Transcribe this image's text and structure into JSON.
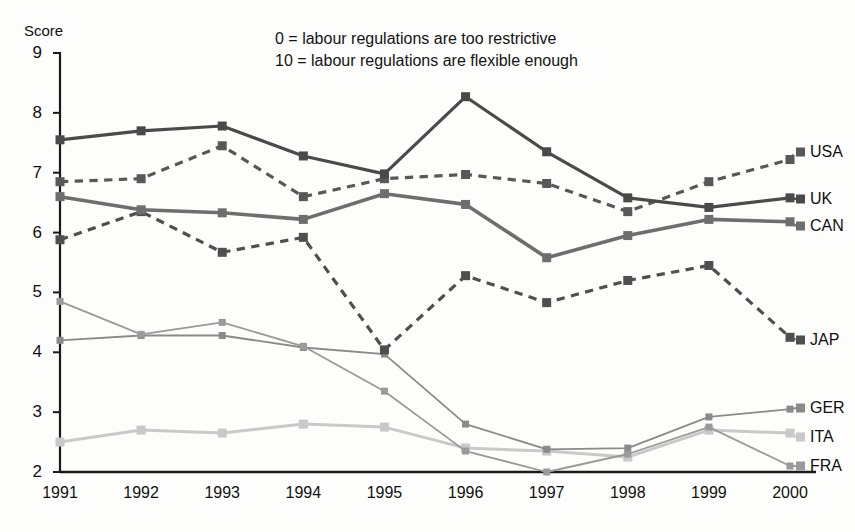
{
  "chart_data": {
    "type": "line",
    "title": "",
    "xlabel": "",
    "ylabel": "Score",
    "categories": [
      "1991",
      "1992",
      "1993",
      "1994",
      "1995",
      "1996",
      "1997",
      "1998",
      "1999",
      "2000"
    ],
    "ylim": [
      2,
      9
    ],
    "yticks": [
      2,
      3,
      4,
      5,
      6,
      7,
      8,
      9
    ],
    "grid": false,
    "legend_position": "right-of-plot-end-labels",
    "annotations": [
      "0 = labour regulations are too restrictive",
      "10 = labour regulations are flexible enough"
    ],
    "series": [
      {
        "name": "UK",
        "style": "solid",
        "color": "#4a4a4a",
        "width": 3.2,
        "values": [
          7.55,
          7.7,
          7.78,
          7.28,
          6.98,
          8.27,
          7.35,
          6.58,
          6.42,
          6.58
        ]
      },
      {
        "name": "CAN",
        "style": "solid",
        "color": "#6e6e6e",
        "width": 3.6,
        "values": [
          6.6,
          6.38,
          6.33,
          6.22,
          6.65,
          6.47,
          5.58,
          5.95,
          6.22,
          6.18
        ]
      },
      {
        "name": "USA",
        "style": "dashed",
        "color": "#585858",
        "width": 3.2,
        "values": [
          6.85,
          6.9,
          7.45,
          6.6,
          6.9,
          6.97,
          6.82,
          6.35,
          6.85,
          7.22
        ]
      },
      {
        "name": "JAP",
        "style": "dashed",
        "color": "#4f4f4f",
        "width": 3.2,
        "values": [
          5.88,
          6.35,
          5.67,
          5.92,
          4.04,
          5.28,
          4.83,
          5.2,
          5.45,
          4.25
        ]
      },
      {
        "name": "FRA",
        "style": "solid",
        "color": "#9a9a9a",
        "width": 1.8,
        "values": [
          4.85,
          4.3,
          4.5,
          4.1,
          3.35,
          2.35,
          2.0,
          2.3,
          2.75,
          2.1
        ]
      },
      {
        "name": "GER",
        "style": "solid",
        "color": "#8a8a8a",
        "width": 1.8,
        "values": [
          4.2,
          4.28,
          4.28,
          4.08,
          3.97,
          2.8,
          2.38,
          2.4,
          2.92,
          3.05
        ]
      },
      {
        "name": "ITA",
        "style": "solid",
        "color": "#c9c9c9",
        "width": 3.0,
        "values": [
          2.5,
          2.7,
          2.65,
          2.8,
          2.75,
          2.4,
          2.35,
          2.25,
          2.7,
          2.65
        ]
      }
    ]
  },
  "axes": {
    "y_axis_title": "Score"
  }
}
